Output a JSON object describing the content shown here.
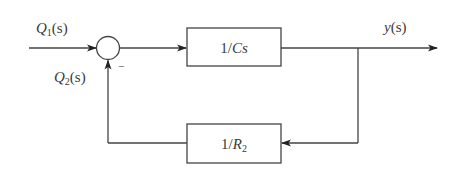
{
  "diagram": {
    "type": "block-diagram",
    "colors": {
      "line": "#444444",
      "text": "#3a3a3a",
      "background": "#ffffff"
    },
    "inputs": [
      {
        "id": "q1",
        "label_main": "Q",
        "label_sub": "1",
        "label_tail": "(s)"
      },
      {
        "id": "q2",
        "label_main": "Q",
        "label_sub": "2",
        "label_tail": "(s)"
      }
    ],
    "summing_junction": {
      "signs": {
        "q1": "+",
        "feedback": "−"
      },
      "minus_label": "−"
    },
    "forward_block": {
      "label": "1/Cs"
    },
    "feedback_block": {
      "label_main": "1/",
      "label_var": "R",
      "label_sub": "2"
    },
    "output": {
      "label_main": "y",
      "label_tail": "(s)"
    }
  }
}
